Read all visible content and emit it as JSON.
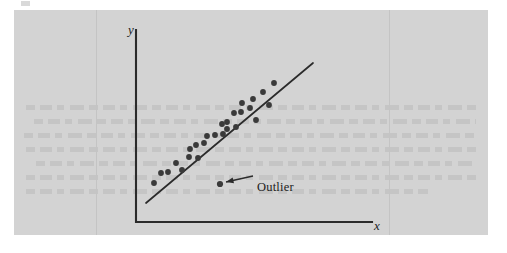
{
  "figure": {
    "kind": "scatterplot-with-regression-line",
    "background_color": "#ffffff",
    "panel_color": "#d3d3d3",
    "ink_color": "#2b2b2b",
    "point_color": "#3a3a3a",
    "panel": {
      "x": 14,
      "y": 10,
      "width": 474,
      "height": 225
    }
  },
  "labels": {
    "y_axis": "y",
    "x_axis": "x",
    "annotation": "Outlier"
  },
  "chart_data": {
    "type": "scatter",
    "title": "",
    "xlabel": "x",
    "ylabel": "y",
    "grid": false,
    "legend": null,
    "axes": {
      "origin_px": {
        "x": 136,
        "y": 222
      },
      "y_axis_top_px": {
        "x": 136,
        "y": 30
      },
      "x_axis_right_px": {
        "x": 372,
        "y": 222
      },
      "arrowless": true
    },
    "points_px": [
      {
        "x": 154,
        "y": 183
      },
      {
        "x": 161,
        "y": 173
      },
      {
        "x": 168,
        "y": 172
      },
      {
        "x": 176,
        "y": 163
      },
      {
        "x": 182,
        "y": 170
      },
      {
        "x": 189,
        "y": 157
      },
      {
        "x": 190,
        "y": 149
      },
      {
        "x": 196,
        "y": 145
      },
      {
        "x": 198,
        "y": 158
      },
      {
        "x": 204,
        "y": 143
      },
      {
        "x": 207,
        "y": 136
      },
      {
        "x": 215,
        "y": 135
      },
      {
        "x": 222,
        "y": 124
      },
      {
        "x": 223,
        "y": 134
      },
      {
        "x": 227,
        "y": 122
      },
      {
        "x": 227,
        "y": 129
      },
      {
        "x": 234,
        "y": 113
      },
      {
        "x": 236,
        "y": 127
      },
      {
        "x": 241,
        "y": 112
      },
      {
        "x": 242,
        "y": 103
      },
      {
        "x": 250,
        "y": 108
      },
      {
        "x": 253,
        "y": 99
      },
      {
        "x": 256,
        "y": 120
      },
      {
        "x": 263,
        "y": 92
      },
      {
        "x": 269,
        "y": 105
      },
      {
        "x": 274,
        "y": 83
      }
    ],
    "outlier_point_px": {
      "x": 220,
      "y": 184
    },
    "regression_line_px": {
      "x1": 146,
      "y1": 203,
      "x2": 313,
      "y2": 63
    },
    "annotation_arrow_px": {
      "tail_x": 253,
      "tail_y": 176,
      "head_x": 226,
      "head_y": 182
    }
  }
}
